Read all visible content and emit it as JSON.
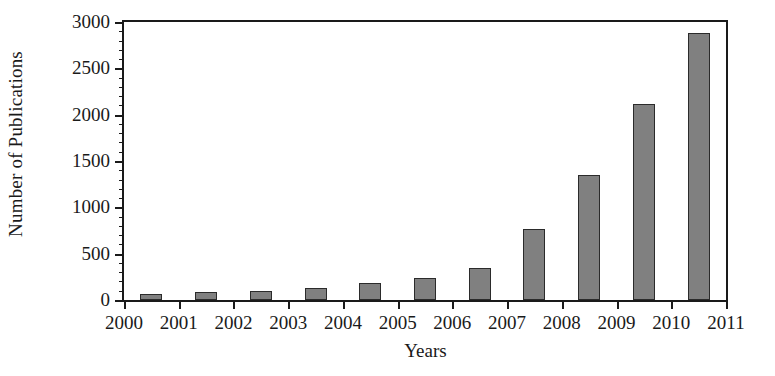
{
  "chart_data": {
    "type": "bar",
    "title": "",
    "xlabel": "Years",
    "ylabel": "Number of Publications",
    "categories": [
      "2000",
      "2001",
      "2002",
      "2003",
      "2004",
      "2005",
      "2006",
      "2007",
      "2008",
      "2009",
      "2010"
    ],
    "values": [
      65,
      90,
      100,
      135,
      180,
      240,
      350,
      765,
      1350,
      2120,
      2880
    ],
    "ylim": [
      0,
      3000
    ],
    "y_major_ticks": [
      0,
      500,
      1000,
      1500,
      2000,
      2500,
      3000
    ],
    "y_tick_labels": [
      "0",
      "500",
      "1000",
      "1500",
      "2000",
      "2500",
      "3000"
    ],
    "y_minor_tick_interval": 100,
    "x_tick_labels": [
      "2000",
      "2001",
      "2002",
      "2003",
      "2004",
      "2005",
      "2006",
      "2007",
      "2008",
      "2009",
      "2010",
      "2011"
    ],
    "grid": false,
    "legend": null,
    "bar_color": "#808080",
    "bar_edge_color": "#2b2b2b",
    "axis_color": "#1a1a1a",
    "background_color": "#ffffff"
  }
}
